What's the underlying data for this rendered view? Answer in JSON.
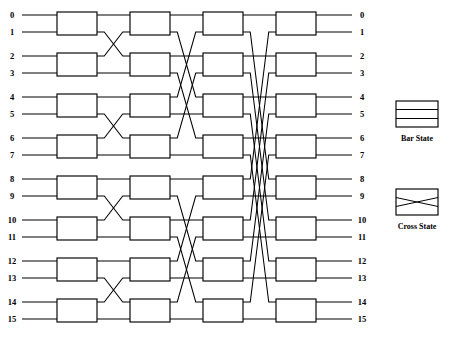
{
  "diagram": {
    "type": "butterfly-switching-network",
    "num_ports": 16,
    "num_stages": 4,
    "switches_per_stage": 8,
    "input_labels": [
      "0",
      "1",
      "2",
      "3",
      "4",
      "5",
      "6",
      "7",
      "8",
      "9",
      "10",
      "11",
      "12",
      "13",
      "14",
      "15"
    ],
    "output_labels": [
      "0",
      "1",
      "2",
      "3",
      "4",
      "5",
      "6",
      "7",
      "8",
      "9",
      "10",
      "11",
      "12",
      "13",
      "14",
      "15"
    ],
    "stage_shuffle_distances": [
      1,
      2,
      4
    ],
    "line_color": "#000000",
    "background_color": "#ffffff"
  },
  "legend": {
    "items": [
      {
        "name": "bar-state",
        "label": "Bar State"
      },
      {
        "name": "cross-state",
        "label": "Cross State"
      }
    ]
  },
  "geometry": {
    "row_top_y": 15,
    "row_gap_in_pair": 17,
    "pair_pitch": 41,
    "stage_x": [
      57,
      130,
      203,
      276
    ],
    "box_w": 40,
    "box_pad_top": 3,
    "left_wire_x": 22,
    "right_wire_x": 352,
    "label_left_x": 12,
    "label_right_x": 362
  }
}
